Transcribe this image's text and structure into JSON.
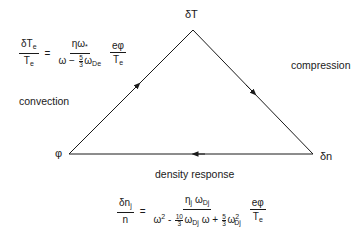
{
  "diagram": {
    "type": "triangle-feedback-loop",
    "vertices": {
      "top": "δT",
      "left": "φ",
      "right": "δn"
    },
    "edge_labels": {
      "left": "convection",
      "right": "compression",
      "bottom": "density response"
    },
    "edges": [
      {
        "from": "φ",
        "to": "δT",
        "label": "convection"
      },
      {
        "from": "δT",
        "to": "δn",
        "label": "compression"
      },
      {
        "from": "δn",
        "to": "φ",
        "label": "density response"
      }
    ],
    "line_color": "#1a1a1a"
  },
  "equations": {
    "temperature": {
      "lhs_num": "δT",
      "lhs_num_sub": "e",
      "lhs_den": "T",
      "lhs_den_sub": "e",
      "equals": "=",
      "rhs_num": "ηω",
      "rhs_num_sub": "*",
      "rhs_den_pre": "ω −",
      "rhs_den_frac_num": "5",
      "rhs_den_frac_den": "3",
      "rhs_den_post": "ω",
      "rhs_den_post_sub": "De",
      "factor_num": "eφ",
      "factor_den": "T",
      "factor_den_sub": "e"
    },
    "density": {
      "lhs_num": "δn",
      "lhs_num_sub": "j",
      "lhs_den": "n",
      "equals": "=",
      "rhs_num_a": "η",
      "rhs_num_a_sub": "j",
      "rhs_num_b": "ω",
      "rhs_num_b_sub": "Dj",
      "den_t1": "ω",
      "den_t1_sup": "2",
      "den_op1": "-",
      "den_f1_num": "10",
      "den_f1_den": "3",
      "den_t2": "ω",
      "den_t2_sub": "Dj",
      "den_t2_post": "ω",
      "den_op2": "+",
      "den_f2_num": "5",
      "den_f2_den": "3",
      "den_t3": "ω",
      "den_t3_sup": "2",
      "den_t3_sub": "Dj",
      "factor_num": "eφ",
      "factor_den": "T",
      "factor_den_sub": "e"
    }
  }
}
